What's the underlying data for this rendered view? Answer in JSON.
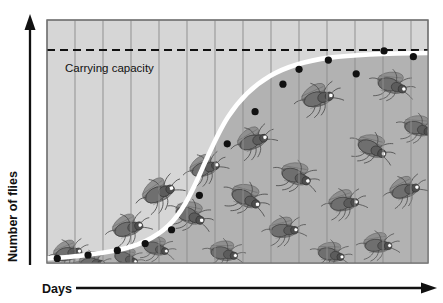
{
  "figure": {
    "kind": "line-chart-with-illustration",
    "background_color": "#ffffff"
  },
  "axes": {
    "y_label": "Number of flies",
    "x_label": "Days",
    "y_axis_icon": "up-arrow-icon",
    "x_axis_icon": "right-arrow-icon",
    "axis_color": "#111111"
  },
  "annotations": {
    "carrying_capacity_label": "Carrying capacity",
    "carrying_capacity_line_style": "dashed",
    "carrying_capacity_color": "#111111"
  },
  "colors": {
    "plot_background": "#d6d6d6",
    "area_under_curve": "#b2b2b2",
    "gridline": "#8f8f8f",
    "curve": "#ffffff",
    "point": "#111111",
    "plot_border": "#6f6f6f",
    "fly_body": "#6b6b6b",
    "fly_eye": "#ffffff"
  },
  "chart_data": {
    "type": "line",
    "title": "",
    "subtitle": "",
    "xlabel": "Days",
    "ylabel": "Number of flies",
    "xlim": [
      0,
      13
    ],
    "ylim": [
      0,
      1.06
    ],
    "grid": true,
    "gridlines_x": 13,
    "legend": "none",
    "annotations": [
      {
        "text": "Carrying capacity",
        "type": "hline",
        "y": 0.92,
        "style": "dashed"
      }
    ],
    "series": [
      {
        "name": "Logistic growth curve",
        "style": "white-thick-line",
        "x": [
          0.0,
          0.5,
          1.0,
          1.5,
          2.0,
          2.5,
          3.0,
          3.5,
          4.0,
          4.5,
          5.0,
          5.5,
          6.0,
          6.5,
          7.0,
          7.5,
          8.0,
          8.5,
          9.0,
          9.5,
          10.0,
          10.5,
          11.0,
          11.5,
          12.0,
          12.5,
          13.0
        ],
        "y": [
          0.02,
          0.025,
          0.03,
          0.04,
          0.05,
          0.065,
          0.09,
          0.12,
          0.17,
          0.24,
          0.33,
          0.44,
          0.55,
          0.64,
          0.72,
          0.78,
          0.82,
          0.855,
          0.88,
          0.895,
          0.905,
          0.912,
          0.917,
          0.92,
          0.922,
          0.923,
          0.924
        ]
      },
      {
        "name": "Observed fly counts",
        "style": "black-dots",
        "x": [
          0.35,
          1.4,
          2.4,
          3.35,
          4.25,
          5.2,
          6.15,
          7.1,
          8.05,
          8.6,
          9.6,
          10.55,
          11.5,
          12.5
        ],
        "y": [
          0.02,
          0.035,
          0.055,
          0.085,
          0.145,
          0.295,
          0.52,
          0.66,
          0.78,
          0.845,
          0.885,
          0.825,
          0.925,
          0.9
        ]
      }
    ]
  },
  "illustrations": {
    "label": "fruit-fly-drawings",
    "count": 16,
    "description": "Drosophila fruit flies drawn under the population curve",
    "flies": [
      {
        "x": 68,
        "y": 253,
        "scale": 0.8,
        "rot": -18
      },
      {
        "x": 92,
        "y": 263,
        "scale": 0.72,
        "rot": -8
      },
      {
        "x": 128,
        "y": 228,
        "scale": 0.86,
        "rot": -22
      },
      {
        "x": 126,
        "y": 258,
        "scale": 0.7,
        "rot": 12
      },
      {
        "x": 159,
        "y": 193,
        "scale": 0.92,
        "rot": -30
      },
      {
        "x": 156,
        "y": 248,
        "scale": 0.74,
        "rot": 8
      },
      {
        "x": 190,
        "y": 215,
        "scale": 0.88,
        "rot": 16
      },
      {
        "x": 205,
        "y": 168,
        "scale": 0.84,
        "rot": -24
      },
      {
        "x": 224,
        "y": 253,
        "scale": 0.8,
        "rot": 4
      },
      {
        "x": 246,
        "y": 198,
        "scale": 0.9,
        "rot": 20
      },
      {
        "x": 253,
        "y": 141,
        "scale": 0.86,
        "rot": -26
      },
      {
        "x": 284,
        "y": 230,
        "scale": 0.82,
        "rot": -10
      },
      {
        "x": 296,
        "y": 176,
        "scale": 0.88,
        "rot": 14
      },
      {
        "x": 318,
        "y": 98,
        "scale": 0.9,
        "rot": -20
      },
      {
        "x": 331,
        "y": 254,
        "scale": 0.78,
        "rot": 6
      },
      {
        "x": 344,
        "y": 203,
        "scale": 0.84,
        "rot": -14
      },
      {
        "x": 372,
        "y": 148,
        "scale": 0.88,
        "rot": 18
      },
      {
        "x": 378,
        "y": 245,
        "scale": 0.8,
        "rot": -6
      },
      {
        "x": 392,
        "y": 85,
        "scale": 0.86,
        "rot": 10
      },
      {
        "x": 405,
        "y": 190,
        "scale": 0.84,
        "rot": -22
      },
      {
        "x": 418,
        "y": 128,
        "scale": 0.82,
        "rot": 8
      }
    ]
  },
  "geometry": {
    "plot_left": 47,
    "plot_right": 428,
    "plot_top": 20,
    "plot_bottom": 263,
    "gridline_spacing": 28,
    "carrying_capacity_y": 50,
    "point_radius": 3.6,
    "curve_width": 4.5
  }
}
